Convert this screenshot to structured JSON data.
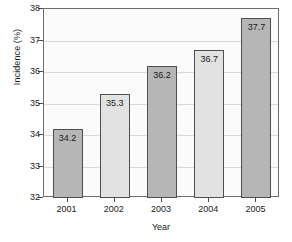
{
  "chart_data": {
    "type": "bar",
    "title": "",
    "xlabel": "Year",
    "ylabel": "Incidence (%)",
    "categories": [
      "2001",
      "2002",
      "2003",
      "2004",
      "2005"
    ],
    "values": [
      34.2,
      35.3,
      36.2,
      36.7,
      37.7
    ],
    "value_labels": [
      "34.2",
      "35.3",
      "36.2",
      "36.7",
      "37.7"
    ],
    "series": [
      {
        "name": "Incidence",
        "values": [
          34.2,
          35.3,
          36.2,
          36.7,
          37.7
        ]
      }
    ],
    "ylim": [
      32,
      38
    ],
    "xlim_categories": 5,
    "ytick_labels": [
      "32",
      "33",
      "34",
      "35",
      "36",
      "37",
      "38"
    ],
    "ytick_values": [
      32,
      33,
      34,
      35,
      36,
      37,
      38
    ],
    "grid": true,
    "grid_axis": "y",
    "legend": false,
    "legend_position": "none",
    "bar_colors": [
      "#b6b6b6",
      "#e2e2e2",
      "#b6b6b6",
      "#e2e2e2",
      "#b6b6b6"
    ],
    "bar_color_dark": "#b6b6b6",
    "bar_color_light": "#e2e2e2",
    "bar_border_color": "#4f4f4f",
    "grid_color": "#d8d8d8",
    "axis_color": "#6e6e6e",
    "text_color": "#1a1a1a",
    "plot_background": "#fbfbfb",
    "figure_background": "#ffffff",
    "value_label_position": "inside-top"
  }
}
